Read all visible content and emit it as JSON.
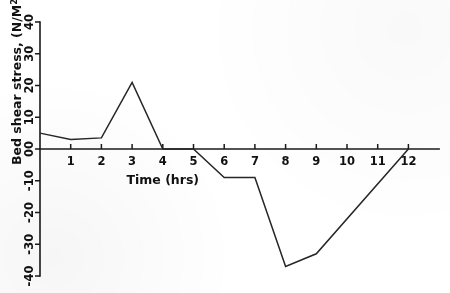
{
  "chart_data": {
    "type": "line",
    "title": "",
    "xlabel": "Time (hrs)",
    "ylabel": "Bed shear stress, (N/M²)",
    "ylabel_parts": {
      "text_main": "Bed shear stress,",
      "units": "(N/M",
      "exponent": "2",
      "units_close": ")"
    },
    "xlim": [
      0,
      13.0
    ],
    "ylim": [
      -40,
      40
    ],
    "grid": false,
    "legend": null,
    "x_ticks": [
      1,
      2,
      3,
      4,
      5,
      6,
      7,
      8,
      9,
      10,
      11,
      12
    ],
    "x_tick_labels": [
      "1",
      "2",
      "3",
      "4",
      "5",
      "6",
      "7",
      "8",
      "9",
      "10",
      "11",
      "12"
    ],
    "y_ticks": [
      -40,
      -30,
      -20,
      -10,
      0,
      10,
      20,
      30,
      40
    ],
    "y_tick_labels": [
      "-40",
      "-30",
      "-20",
      "-10",
      "00",
      "10",
      "20",
      "30",
      "40"
    ],
    "x": [
      0,
      1,
      2,
      3,
      4,
      5,
      6,
      7,
      8,
      9,
      12
    ],
    "values": [
      5,
      3,
      3.5,
      21,
      0,
      0,
      -9,
      -9,
      -37,
      -33,
      0
    ],
    "series": [
      {
        "name": "Bed shear stress",
        "points": [
          {
            "x": 0,
            "y": 5
          },
          {
            "x": 1,
            "y": 3
          },
          {
            "x": 2,
            "y": 3.5
          },
          {
            "x": 3,
            "y": 21
          },
          {
            "x": 4,
            "y": 0
          },
          {
            "x": 5,
            "y": 0
          },
          {
            "x": 6,
            "y": -9
          },
          {
            "x": 7,
            "y": -9
          },
          {
            "x": 8,
            "y": -37
          },
          {
            "x": 9,
            "y": -33
          },
          {
            "x": 12,
            "y": 0
          }
        ],
        "color": "#262626"
      }
    ],
    "annotations": [],
    "colors": {
      "line": "#262626",
      "axis": "#1a1a1a",
      "background": "#ffffff",
      "text": "#111111"
    }
  }
}
